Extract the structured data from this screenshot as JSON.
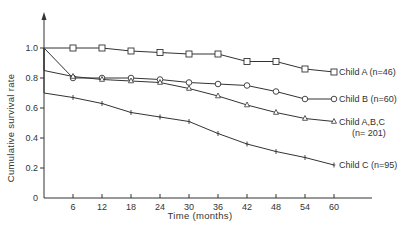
{
  "chart_data": {
    "type": "line",
    "title": "",
    "xlabel": "Time (months)",
    "ylabel": "Cumulative survival rate",
    "xlim": [
      0,
      60
    ],
    "ylim": [
      0,
      1.0
    ],
    "x_ticks": [
      6,
      12,
      18,
      24,
      30,
      36,
      42,
      48,
      54,
      60
    ],
    "y_ticks": [
      0,
      0.2,
      0.4,
      0.6,
      0.8,
      1.0
    ],
    "y_tick_labels": [
      "0",
      "0.2",
      "0.4",
      "0.6",
      "0.8",
      "1.0"
    ],
    "grid": false,
    "legend_position": "inline-right",
    "x": [
      0,
      6,
      12,
      18,
      24,
      30,
      36,
      42,
      48,
      54,
      60
    ],
    "series": [
      {
        "name": "Child A (n=46)",
        "label_lines": [
          "Child A (n=46)"
        ],
        "marker": "square",
        "values": [
          1.0,
          1.0,
          1.0,
          0.98,
          0.97,
          0.96,
          0.96,
          0.91,
          0.91,
          0.86,
          0.84
        ]
      },
      {
        "name": "Child B (n=60)",
        "label_lines": [
          "Child B (n=60)"
        ],
        "marker": "circle",
        "values": [
          1.0,
          0.8,
          0.8,
          0.8,
          0.79,
          0.77,
          0.76,
          0.75,
          0.71,
          0.66,
          0.66
        ]
      },
      {
        "name": "Child A,B,C (n= 201)",
        "label_lines": [
          "Child A,B,C",
          "(n= 201)"
        ],
        "marker": "triangle",
        "values": [
          0.85,
          0.81,
          0.79,
          0.78,
          0.77,
          0.73,
          0.68,
          0.62,
          0.57,
          0.53,
          0.51
        ]
      },
      {
        "name": "Child C (n=95)",
        "label_lines": [
          "Child C (n=95)"
        ],
        "marker": "cross",
        "values": [
          0.7,
          0.67,
          0.63,
          0.57,
          0.54,
          0.51,
          0.43,
          0.36,
          0.31,
          0.27,
          0.22
        ]
      }
    ],
    "initial_drop": {
      "note": "All series start at 1.0 at t=0 with vertical drop for A,B,C and C",
      "start_value": 1.0
    }
  },
  "labels": {
    "xlabel": "Time (months)",
    "ylabel": "Cumulative survival rate",
    "series_a": "Child A (n=46)",
    "series_b": "Child B (n=60)",
    "series_abc_1": "Child A,B,C",
    "series_abc_2": "(n= 201)",
    "series_c": "Child C (n=95)"
  }
}
